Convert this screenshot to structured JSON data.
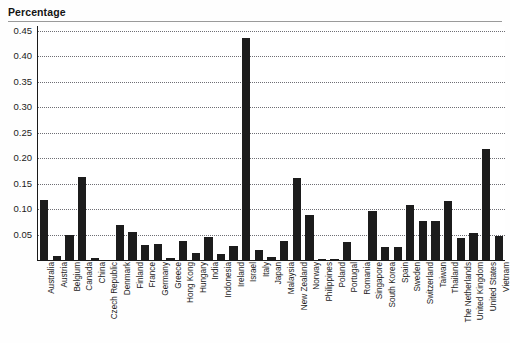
{
  "chart": {
    "title": "Percentage",
    "axis": {
      "y_ticks": [
        "0.45",
        "0.40",
        "0.35",
        "0.30",
        "0.25",
        "0.20",
        "0.15",
        "0.10",
        "0.05"
      ]
    }
  },
  "chart_data": {
    "type": "bar",
    "title": "Percentage",
    "xlabel": "",
    "ylabel": "Percentage",
    "ylim": [
      0,
      0.45
    ],
    "ytick_values": [
      0.05,
      0.1,
      0.15,
      0.2,
      0.25,
      0.3,
      0.35,
      0.4,
      0.45
    ],
    "grid": true,
    "legend": false,
    "bar_color": "#1c1c1c",
    "categories": [
      "Australia",
      "Austria",
      "Belgium",
      "Canada",
      "China",
      "Czech Republic",
      "Denmark",
      "Finland",
      "France",
      "Germany",
      "Greece",
      "Hong Kong",
      "Hungary",
      "India",
      "Indonesia",
      "Ireland",
      "Israel",
      "Italy",
      "Japan",
      "Malaysia",
      "New Zealand",
      "Norway",
      "Philippines",
      "Poland",
      "Portugal",
      "Romania",
      "Singapore",
      "South Korea",
      "Spain",
      "Sweden",
      "Switzerland",
      "Taiwan",
      "Thailand",
      "The Netherlands",
      "United Kingdom",
      "United States",
      "Vietnam"
    ],
    "values": [
      0.118,
      0.007,
      0.05,
      0.163,
      0.004,
      0.0,
      0.068,
      0.056,
      0.03,
      0.032,
      0.003,
      0.037,
      0.013,
      0.046,
      0.012,
      0.027,
      0.437,
      0.02,
      0.006,
      0.038,
      0.161,
      0.088,
      0.002,
      0.002,
      0.036,
      0.0,
      0.097,
      0.025,
      0.025,
      0.108,
      0.077,
      0.077,
      0.115,
      0.044,
      0.054,
      0.219,
      0.047
    ]
  }
}
